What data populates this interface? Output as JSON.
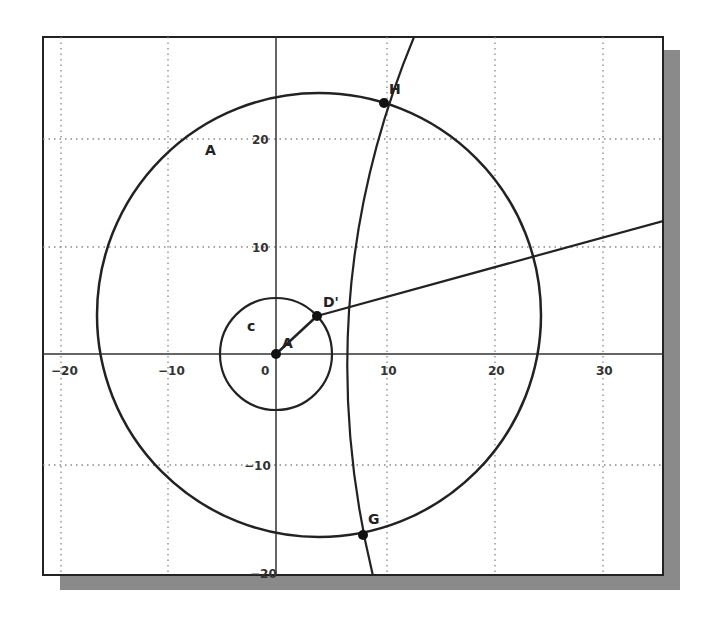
{
  "figure": {
    "type": "geometry-construction",
    "frame": {
      "left": 43,
      "top": 37,
      "right": 663,
      "bottom": 575
    },
    "colors": {
      "stroke": "#222222",
      "grid": "#888888",
      "shadow": "#8a8a8a",
      "background": "#ffffff"
    }
  },
  "axes": {
    "origin_px": [
      276,
      354
    ],
    "px_per_unit": 10.85,
    "x_ticks": [
      {
        "value": -20,
        "label": "−20"
      },
      {
        "value": -10,
        "label": "−10"
      },
      {
        "value": 0,
        "label": "0"
      },
      {
        "value": 10,
        "label": "10"
      },
      {
        "value": 20,
        "label": "20"
      },
      {
        "value": 30,
        "label": "30"
      }
    ],
    "y_ticks": [
      {
        "value": 20,
        "label": "20"
      },
      {
        "value": 10,
        "label": "10"
      },
      {
        "value": -10,
        "label": "−10"
      },
      {
        "value": -20,
        "label": "−20"
      }
    ],
    "grid": "dotted"
  },
  "points": {
    "A": {
      "label": "A",
      "x": 0,
      "y": 0
    },
    "D_prime": {
      "label": "D'",
      "x": 3.8,
      "y": 3.5
    },
    "H": {
      "label": "H",
      "x": 10,
      "y": 23
    },
    "G": {
      "label": "G",
      "x": 8,
      "y": -17
    },
    "stray": {
      "label": "A"
    }
  },
  "circles": {
    "small": {
      "label": "c",
      "center": "A",
      "radius": 5.2
    },
    "large": {
      "center_approx": [
        4,
        3.5
      ],
      "radius": 20.5
    }
  },
  "labels": {
    "c": "c",
    "A": "A",
    "D_prime": "D'",
    "H": "H",
    "G": "G",
    "stray_A": "A"
  }
}
